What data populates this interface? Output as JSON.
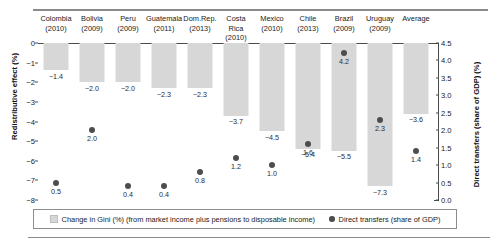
{
  "chart_data": {
    "type": "bar",
    "title": "",
    "categories": [
      "Colombia (2010)",
      "Bolivia (2009)",
      "Peru (2009)",
      "Guatemala (2011)",
      "Dom.Rep. (2013)",
      "Costa Rica (2010)",
      "Mexico (2010)",
      "Chile (2013)",
      "Brazil (2009)",
      "Uruguay (2009)",
      "Average"
    ],
    "category_names": [
      "Colombia",
      "Bolivia",
      "Peru",
      "Guatemala",
      "Dom.Rep.",
      "Costa Rica",
      "Mexico",
      "Chile",
      "Brazil",
      "Uruguay",
      "Average"
    ],
    "category_years": [
      "(2010)",
      "(2009)",
      "(2009)",
      "(2011)",
      "(2013)",
      "(2010)",
      "(2010)",
      "(2013)",
      "(2009)",
      "(2009)",
      ""
    ],
    "series": [
      {
        "name": "Change in Gini (%) (from market income plus pensions to disposable income)",
        "type": "bar",
        "axis": "left",
        "color": "#d7d7d7",
        "values": [
          -1.4,
          -2.0,
          -2.0,
          -2.3,
          -2.3,
          -3.7,
          -4.5,
          -5.4,
          -5.5,
          -7.3,
          -3.6
        ],
        "labels": [
          "-1.4",
          "-2.0",
          "-2.0",
          "-2.3",
          "-2.3",
          "-3.7",
          "-4.5",
          "-5.4",
          "-5.5",
          "-7.3",
          "-3.6"
        ]
      },
      {
        "name": "Direct transfers (share of GDP)",
        "type": "scatter",
        "axis": "right",
        "color": "#4d4d4d",
        "values": [
          0.5,
          2.0,
          0.4,
          0.4,
          0.8,
          1.2,
          1.0,
          1.6,
          4.2,
          2.3,
          1.4
        ],
        "labels": [
          "0.5",
          "2.0",
          "0.4",
          "0.4",
          "0.8",
          "1.2",
          "1.0",
          "1.6",
          "4.2",
          "2.3",
          "1.4"
        ]
      }
    ],
    "ylabel": "Redistributive effect (%)",
    "ylabel_right": "Direct transfers (share of GDP) (%)",
    "xlabel": "",
    "ylim": [
      -8,
      0
    ],
    "ylim_right": [
      0.0,
      4.5
    ],
    "yticks_left": [
      "0",
      "-1",
      "-2",
      "-3",
      "-4",
      "-5",
      "-6",
      "-7",
      "-8"
    ],
    "yticks_left_values": [
      0,
      -1,
      -2,
      -3,
      -4,
      -5,
      -6,
      -7,
      -8
    ],
    "yticks_right": [
      "4.5",
      "4.0",
      "3.5",
      "3.0",
      "2.5",
      "2.0",
      "1.5",
      "1.0",
      "0.5",
      "0.0"
    ],
    "yticks_right_values": [
      4.5,
      4.0,
      3.5,
      3.0,
      2.5,
      2.0,
      1.5,
      1.0,
      0.5,
      0.0
    ],
    "grid": false,
    "legend_position": "bottom"
  },
  "legend": {
    "items": [
      {
        "label": "Change in Gini (%) (from market income plus pensions to disposable income)",
        "marker": "square"
      },
      {
        "label": "Direct transfers (share of GDP)",
        "marker": "circle"
      }
    ]
  }
}
